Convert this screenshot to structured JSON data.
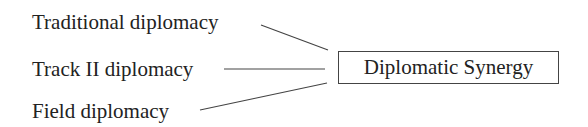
{
  "diagram": {
    "sources": [
      {
        "label": "Traditional diplomacy"
      },
      {
        "label": "Track II diplomacy"
      },
      {
        "label": "Field diplomacy"
      }
    ],
    "target": {
      "label": "Diplomatic Synergy"
    },
    "edges": [
      {
        "from": "Traditional diplomacy",
        "to": "Diplomatic Synergy"
      },
      {
        "from": "Track II diplomacy",
        "to": "Diplomatic Synergy"
      },
      {
        "from": "Field diplomacy",
        "to": "Diplomatic Synergy"
      }
    ],
    "colors": {
      "text": "#222222",
      "line": "#444444",
      "background": "#ffffff"
    }
  }
}
